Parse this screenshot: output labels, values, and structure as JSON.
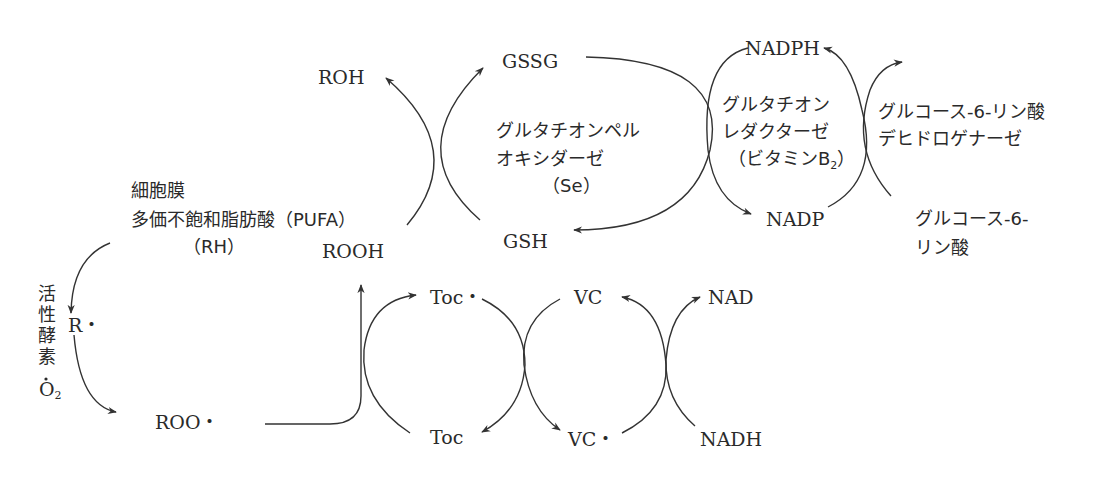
{
  "diagram": {
    "title": "",
    "colors": {
      "ink": "#2a2a2a",
      "line": "#333333",
      "background": "#ffffff"
    },
    "nodes": {
      "roh": "ROH",
      "gssg": "GSSG",
      "nadph": "NADPH",
      "rooh": "ROOH",
      "gsh": "GSH",
      "nadp": "NADP",
      "r_radical": "R・",
      "roo_radical": "ROO・",
      "toc_radical": "Toc・",
      "toc": "Toc",
      "vc": "VC",
      "vc_radical": "VC・",
      "nad": "NAD",
      "nadh": "NADH"
    },
    "membrane": {
      "line1": "細胞膜",
      "line2": "多価不飽和脂肪酸（PUFA）",
      "line3": "（RH）"
    },
    "active_oxygen": {
      "chars": [
        "活",
        "性",
        "酵",
        "素"
      ],
      "o2_main": "O",
      "o2_sub": "2"
    },
    "enzymes": {
      "gpx": {
        "line1": "グルタチオンペル",
        "line2": "オキシダーゼ",
        "line3": "（Se）"
      },
      "gr": {
        "line1": "グルタチオン",
        "line2": "レダクターゼ",
        "line3_main": "（ビタミンB",
        "line3_sub": "2",
        "line3_end": "）"
      },
      "g6pd": {
        "line1": "グルコース-6-リン酸",
        "line2": "デヒドロゲナーゼ"
      }
    },
    "substrate": {
      "line1": "グルコース-6-",
      "line2": "リン酸"
    }
  }
}
